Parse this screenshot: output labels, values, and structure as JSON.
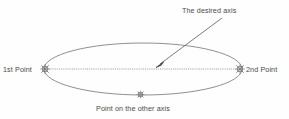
{
  "diagram": {
    "background_color": "#fefefe",
    "line_color": "#6e6e6e",
    "text_color": "#4a4a4a",
    "labels": {
      "desired_axis": "The desired axis",
      "first_point": "1st Point",
      "second_point": "2nd Point",
      "other_axis_point": "Point on the other axis"
    },
    "markers": {
      "first_point_icon": "node-snap-star-icon",
      "second_point_icon": "node-snap-star-icon",
      "other_axis_point_icon": "node-snap-star-icon"
    },
    "shapes": {
      "ellipse": {
        "center_x": 143,
        "center_y": 69,
        "radius_x": 99,
        "radius_y": 26
      },
      "major_axis_line": {
        "x1": 44,
        "y1": 69,
        "x2": 242,
        "y2": 69,
        "style": "dotted"
      },
      "callout_arrow": {
        "x1": 222,
        "y1": 18,
        "x2": 157,
        "y2": 66,
        "style": "solid-with-arrowhead"
      }
    }
  }
}
